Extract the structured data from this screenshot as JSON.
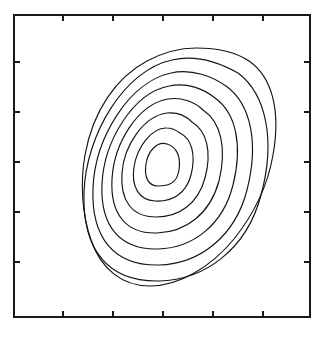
{
  "figure": {
    "background_color": "#ffffff",
    "line_color": "#141414",
    "frame_color": "#1a1a1a",
    "title": "",
    "caption": ""
  },
  "chart_data": {
    "type": "contour",
    "title": "",
    "subtitle": "",
    "xlabel": "",
    "ylabel": "",
    "xlim": [
      0,
      1
    ],
    "ylim": [
      0,
      1
    ],
    "grid": false,
    "legend": false,
    "legend_position": "none",
    "tick_labels_x": [],
    "tick_labels_y": [],
    "annotations": [],
    "n_levels": 8,
    "levels": [
      1,
      2,
      3,
      4,
      5,
      6,
      7,
      8
    ],
    "peak_center_px": [
      162,
      165
    ],
    "orientation_deg": 42,
    "axes_frame_px": {
      "left": 14,
      "top": 15,
      "right": 310,
      "bottom": 317
    },
    "ticks": {
      "direction": "inward",
      "length_px": 6,
      "top_x_px": [
        63,
        113,
        163,
        213,
        263
      ],
      "bottom_x_px": [
        63,
        113,
        163,
        213,
        263
      ],
      "left_y_px": [
        62,
        112,
        162,
        212,
        262
      ],
      "right_y_px": [
        62,
        112,
        162,
        212,
        262
      ]
    },
    "contours": [
      {
        "level": 8,
        "name": "innermost-contour",
        "center_px": [
          162,
          165
        ],
        "semi_major_px": 21,
        "semi_minor_px": 13,
        "rotation_deg": 42,
        "squareness": 0.0,
        "path": "M 167 144 C 177 147 181 157 179 170 C 177 183 169 186 158 186 C 148 186 144 177 146 164 C 148 151 157 141 167 144 Z"
      },
      {
        "level": 7,
        "name": "contour-ring-7",
        "center_px": [
          162,
          166
        ],
        "semi_major_px": 35,
        "semi_minor_px": 22,
        "rotation_deg": 42,
        "squareness": 0.08,
        "path": "M 180 133 C 192 139 196 155 191 175 C 186 194 172 202 155 201 C 139 200 131 187 134 167 C 137 147 152 127 167 128 C 172 128 176 130 180 133 Z"
      },
      {
        "level": 6,
        "name": "contour-ring-6",
        "center_px": [
          162,
          167
        ],
        "semi_major_px": 49,
        "semi_minor_px": 31,
        "rotation_deg": 42,
        "squareness": 0.14,
        "path": "M 192 122 C 207 131 212 152 205 178 C 198 204 179 217 156 217 C 132 217 120 201 122 173 C 124 145 144 116 167 113 C 177 112 186 116 192 122 Z"
      },
      {
        "level": 5,
        "name": "contour-ring-5",
        "center_px": [
          162,
          168
        ],
        "semi_major_px": 62,
        "semi_minor_px": 40,
        "rotation_deg": 42,
        "squareness": 0.2,
        "path": "M 203 110 C 221 122 227 148 219 181 C 210 214 186 232 157 233 C 126 234 110 214 112 179 C 114 143 138 104 168 99 C 182 97 195 102 203 110 Z"
      },
      {
        "level": 4,
        "name": "contour-ring-4",
        "center_px": [
          162,
          169
        ],
        "semi_major_px": 76,
        "semi_minor_px": 49,
        "rotation_deg": 42,
        "squareness": 0.27,
        "path": "M 215 98 C 236 113 243 145 233 185 C 223 225 193 248 158 249 C 120 250 100 226 102 184 C 104 141 133 93 169 86 C 187 82 204 89 215 98 Z"
      },
      {
        "level": 3,
        "name": "contour-ring-3",
        "center_px": [
          162,
          170
        ],
        "semi_major_px": 90,
        "semi_minor_px": 58,
        "rotation_deg": 42,
        "squareness": 0.34,
        "path": "M 226 86 C 251 104 259 143 247 190 C 235 237 199 264 159 265 C 114 266 91 238 93 188 C 95 138 129 82 171 73 C 192 68 213 77 226 86 Z"
      },
      {
        "level": 2,
        "name": "contour-ring-2",
        "center_px": [
          162,
          171
        ],
        "semi_major_px": 104,
        "semi_minor_px": 67,
        "rotation_deg": 42,
        "squareness": 0.42,
        "path": "M 238 73 C 266 94 276 140 261 195 C 247 249 205 280 159 281 C 108 282 82 250 84 192 C 86 135 124 70 172 60 C 197 54 222 64 238 73 Z"
      },
      {
        "level": 1,
        "name": "outermost-contour",
        "center_px": [
          162,
          172
        ],
        "semi_major_px": 118,
        "semi_minor_px": 76,
        "rotation_deg": 42,
        "squareness": 0.5,
        "path": "M 249 61 C 272 77 281 110 273 155 C 268 184 254 214 234 239 C 211 267 179 286 150 286 C 122 286 101 269 91 240 C 82 214 80 183 85 155 C 93 110 117 77 147 61 C 164 52 180 48 196 48 C 214 48 234 51 249 61 Z"
      }
    ]
  }
}
